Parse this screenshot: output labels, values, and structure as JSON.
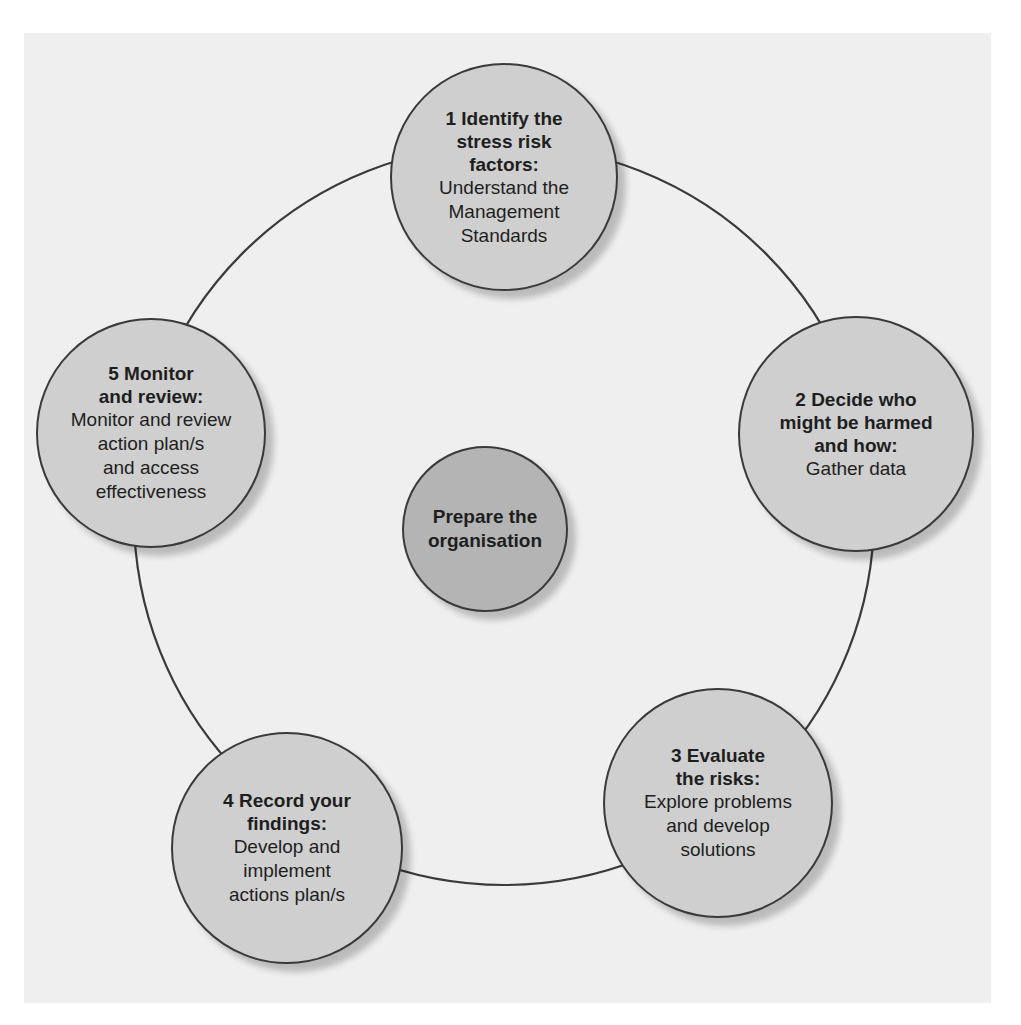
{
  "diagram": {
    "type": "cycle",
    "center": {
      "title": "Prepare the organisation",
      "title_lines": [
        "Prepare the",
        "organisation"
      ]
    },
    "steps": [
      {
        "number": 1,
        "title_lines": [
          "1 Identify the",
          "stress risk",
          "factors:"
        ],
        "desc_lines": [
          "Understand the",
          "Management",
          "Standards"
        ]
      },
      {
        "number": 2,
        "title_lines": [
          "2 Decide who",
          "might be harmed",
          "and how:"
        ],
        "desc_lines": [
          "Gather data"
        ]
      },
      {
        "number": 3,
        "title_lines": [
          "3 Evaluate",
          "the risks:"
        ],
        "desc_lines": [
          "Explore problems",
          "and develop",
          "solutions"
        ]
      },
      {
        "number": 4,
        "title_lines": [
          "4 Record your",
          "findings:"
        ],
        "desc_lines": [
          "Develop and",
          "implement",
          "actions plan/s"
        ]
      },
      {
        "number": 5,
        "title_lines": [
          "5 Monitor",
          "and review:"
        ],
        "desc_lines": [
          "Monitor and review",
          "action plan/s",
          "and access",
          "effectiveness"
        ]
      }
    ],
    "colors": {
      "panel": "#efefef",
      "node_fill": "#cfcfcf",
      "center_fill": "#b4b4b4",
      "stroke": "#3a3a3a",
      "text": "#1e1e1e"
    }
  }
}
